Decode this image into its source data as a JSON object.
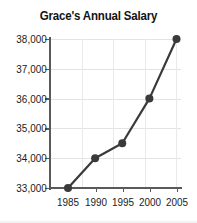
{
  "chart_data": {
    "type": "line",
    "title": "Grace's Annual Salary",
    "xlabel": "",
    "ylabel": "",
    "x": [
      1985,
      1990,
      1995,
      2000,
      2005
    ],
    "categories": [
      "1985",
      "1990",
      "1995",
      "2000",
      "2005"
    ],
    "values": [
      33000,
      34000,
      34500,
      36000,
      38000
    ],
    "series": [
      {
        "name": "Annual Salary",
        "values": [
          33000,
          34000,
          34500,
          36000,
          38000
        ]
      }
    ],
    "ylim": [
      33000,
      38000
    ],
    "xlim": [
      1985,
      2005
    ],
    "ytick_labels": [
      "33,000",
      "34,000",
      "35,000",
      "36,000",
      "37,000",
      "38,000"
    ],
    "ytick_values": [
      33000,
      34000,
      35000,
      36000,
      37000,
      38000
    ],
    "xtick_labels": [
      "1985",
      "1990",
      "1995",
      "2000",
      "2005"
    ],
    "xtick_values": [
      1985,
      1990,
      1995,
      2000,
      2005
    ],
    "grid": true,
    "legend": false,
    "marker": "filled-circle",
    "colors": {
      "line": "#3a3a3a",
      "marker": "#3a3a3a",
      "grid": "#e3e3e3",
      "axis": "#5a5a5a",
      "text": "#1a1a1a",
      "background": "#ffffff"
    }
  }
}
